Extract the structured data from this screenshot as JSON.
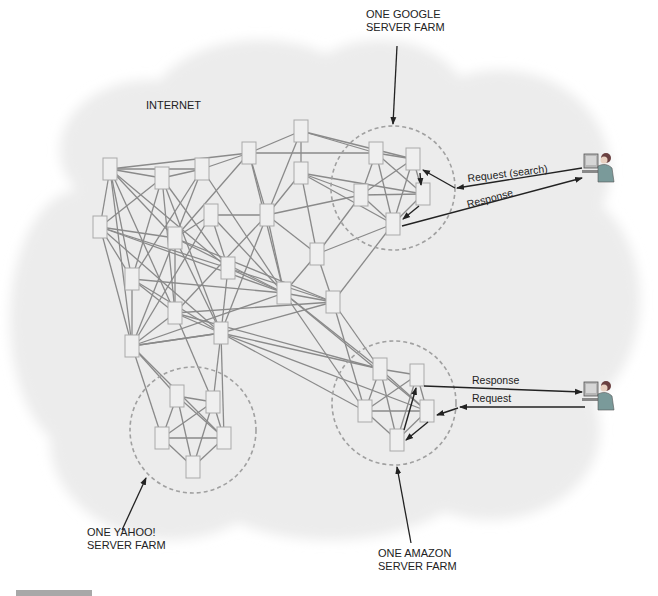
{
  "labels": {
    "internet": "INTERNET",
    "google_farm": "ONE GOOGLE\nSERVER FARM",
    "yahoo_farm": "ONE YAHOO!\nSERVER FARM",
    "amazon_farm": "ONE AMAZON\nSERVER FARM",
    "google_request": "Request (search)",
    "google_response": "Response",
    "amazon_response": "Response",
    "amazon_request": "Request"
  },
  "colors": {
    "cloud": "#ececec",
    "node_fill": "#efefef",
    "node_stroke": "#a9a9a9",
    "link": "#8a8a8a",
    "farm_circle": "#a0a0a0",
    "arrow": "#222222",
    "caption_bar": "#a8a8a8"
  },
  "farms": [
    {
      "name": "google",
      "cx": 393,
      "cy": 188,
      "r": 62
    },
    {
      "name": "yahoo",
      "cx": 193,
      "cy": 430,
      "r": 63
    },
    {
      "name": "amazon",
      "cx": 394,
      "cy": 403,
      "r": 62
    }
  ],
  "nodes": [
    [
      110,
      169
    ],
    [
      162,
      178
    ],
    [
      202,
      169
    ],
    [
      249,
      153
    ],
    [
      301,
      131
    ],
    [
      301,
      173
    ],
    [
      211,
      215
    ],
    [
      267,
      215
    ],
    [
      100,
      227
    ],
    [
      175,
      238
    ],
    [
      317,
      254
    ],
    [
      132,
      279
    ],
    [
      228,
      268
    ],
    [
      284,
      293
    ],
    [
      333,
      302
    ],
    [
      175,
      313
    ],
    [
      221,
      333
    ],
    [
      132,
      346
    ],
    [
      376,
      153
    ],
    [
      413,
      159
    ],
    [
      361,
      195
    ],
    [
      423,
      194
    ],
    [
      393,
      224
    ],
    [
      177,
      396
    ],
    [
      213,
      402
    ],
    [
      162,
      438
    ],
    [
      224,
      438
    ],
    [
      193,
      467
    ],
    [
      380,
      369
    ],
    [
      417,
      375
    ],
    [
      365,
      411
    ],
    [
      427,
      411
    ],
    [
      397,
      440
    ]
  ]
}
